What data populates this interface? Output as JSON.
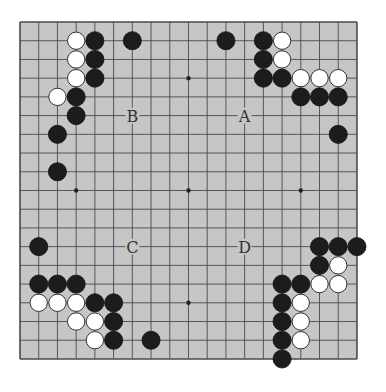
{
  "board": {
    "size": 19,
    "origin_x": 20,
    "origin_y": 22,
    "spacing": 18.72,
    "background": "#c6c6c6",
    "line_color": "#4a4a4a",
    "star_points": [
      [
        3,
        3
      ],
      [
        9,
        3
      ],
      [
        15,
        3
      ],
      [
        3,
        9
      ],
      [
        9,
        9
      ],
      [
        15,
        9
      ],
      [
        3,
        15
      ],
      [
        9,
        15
      ],
      [
        15,
        15
      ]
    ]
  },
  "stones": {
    "black": [
      [
        4,
        1
      ],
      [
        6,
        1
      ],
      [
        4,
        2
      ],
      [
        4,
        3
      ],
      [
        3,
        4
      ],
      [
        3,
        5
      ],
      [
        2,
        6
      ],
      [
        2,
        8
      ],
      [
        11,
        1
      ],
      [
        13,
        1
      ],
      [
        13,
        2
      ],
      [
        13,
        3
      ],
      [
        14,
        3
      ],
      [
        15,
        4
      ],
      [
        16,
        4
      ],
      [
        17,
        4
      ],
      [
        17,
        6
      ],
      [
        1,
        12
      ],
      [
        1,
        14
      ],
      [
        2,
        14
      ],
      [
        3,
        14
      ],
      [
        4,
        15
      ],
      [
        5,
        15
      ],
      [
        5,
        16
      ],
      [
        5,
        17
      ],
      [
        7,
        17
      ],
      [
        16,
        12
      ],
      [
        17,
        12
      ],
      [
        18,
        12
      ],
      [
        16,
        13
      ],
      [
        14,
        14
      ],
      [
        15,
        14
      ],
      [
        14,
        15
      ],
      [
        14,
        16
      ],
      [
        14,
        17
      ],
      [
        14,
        18
      ]
    ],
    "white": [
      [
        3,
        1
      ],
      [
        3,
        2
      ],
      [
        3,
        3
      ],
      [
        2,
        4
      ],
      [
        14,
        1
      ],
      [
        14,
        2
      ],
      [
        15,
        3
      ],
      [
        16,
        3
      ],
      [
        17,
        3
      ],
      [
        1,
        15
      ],
      [
        2,
        15
      ],
      [
        3,
        15
      ],
      [
        3,
        16
      ],
      [
        4,
        16
      ],
      [
        4,
        17
      ],
      [
        17,
        13
      ],
      [
        16,
        14
      ],
      [
        17,
        14
      ],
      [
        15,
        15
      ],
      [
        15,
        16
      ],
      [
        15,
        17
      ]
    ]
  },
  "labels": [
    {
      "text": "B",
      "col": 6,
      "row": 5
    },
    {
      "text": "A",
      "col": 12,
      "row": 5
    },
    {
      "text": "C",
      "col": 6,
      "row": 12
    },
    {
      "text": "D",
      "col": 12,
      "row": 12
    }
  ]
}
